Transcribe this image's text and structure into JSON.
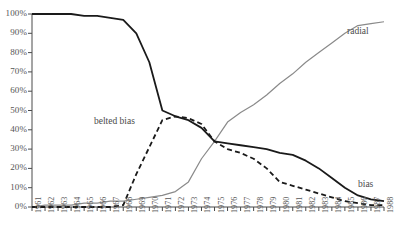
{
  "chart_data": {
    "type": "line",
    "title": "",
    "xlabel": "",
    "ylabel": "",
    "ylim": [
      0,
      100
    ],
    "grid": false,
    "legend_position": "inline-labels",
    "ytick_labels": [
      "0%",
      "10%",
      "20%",
      "30%",
      "40%",
      "50%",
      "60%",
      "70%",
      "80%",
      "90%",
      "100%"
    ],
    "ytick_values": [
      0,
      10,
      20,
      30,
      40,
      50,
      60,
      70,
      80,
      90,
      100
    ],
    "categories": [
      "1961",
      "1962",
      "1963",
      "1964",
      "1965",
      "1966",
      "1967",
      "1968",
      "1969",
      "1970",
      "1971",
      "1972",
      "1973",
      "1974",
      "1975",
      "1976",
      "1977",
      "1978",
      "1979",
      "1980",
      "1981",
      "1982",
      "1983",
      "1984",
      "1985",
      "1986",
      "1987",
      "1988"
    ],
    "series": [
      {
        "name": "bias",
        "style": "solid",
        "color": "#1a1a1a",
        "values": [
          100,
          100,
          100,
          100,
          99,
          99,
          98,
          97,
          90,
          75,
          50,
          47,
          45,
          41,
          34,
          33,
          32,
          31,
          30,
          28,
          27,
          24,
          20,
          15,
          10,
          6,
          4,
          3
        ]
      },
      {
        "name": "belted bias",
        "style": "dashed",
        "color": "#1a1a1a",
        "values": [
          0,
          0,
          0,
          0,
          0,
          0,
          0,
          1,
          17,
          31,
          45,
          47,
          46,
          43,
          34,
          30,
          28,
          25,
          20,
          13,
          11,
          9,
          7,
          5,
          3,
          2,
          1,
          1
        ]
      },
      {
        "name": "radial",
        "style": "solid",
        "color": "#8a8a8a",
        "values": [
          0,
          1,
          1,
          1,
          2,
          2,
          3,
          3,
          4,
          5,
          6,
          8,
          13,
          25,
          34,
          44,
          49,
          53,
          58,
          64,
          69,
          75,
          80,
          85,
          90,
          94,
          95,
          96
        ]
      }
    ],
    "annotations": [
      {
        "text": "radial",
        "x_year": "1986",
        "y_pct": 92
      },
      {
        "text": "belted bias",
        "x_year": "1969",
        "y_pct": 43
      },
      {
        "text": "bias",
        "x_year": "1986",
        "y_pct": 10
      }
    ]
  }
}
